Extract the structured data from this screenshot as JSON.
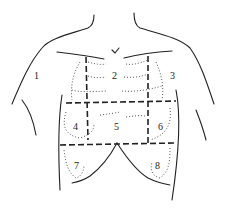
{
  "diagram": {
    "regions": [
      {
        "id": "1",
        "label": "1",
        "x": 34,
        "y": 75
      },
      {
        "id": "2",
        "label": "2",
        "x": 112,
        "y": 75
      },
      {
        "id": "3",
        "label": "3",
        "x": 170,
        "y": 75
      },
      {
        "id": "4",
        "label": "4",
        "x": 73,
        "y": 124
      },
      {
        "id": "5",
        "label": "5",
        "x": 114,
        "y": 124
      },
      {
        "id": "6",
        "label": "6",
        "x": 158,
        "y": 124
      },
      {
        "id": "7",
        "label": "7",
        "x": 74,
        "y": 163
      },
      {
        "id": "8",
        "label": "8",
        "x": 155,
        "y": 163
      }
    ]
  }
}
